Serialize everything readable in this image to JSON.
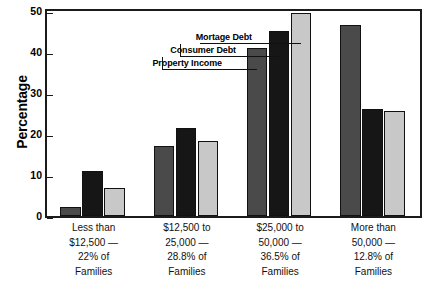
{
  "chart_data": {
    "type": "bar",
    "title": "",
    "xlabel": "",
    "ylabel": "Percentage",
    "ylim": [
      0,
      50
    ],
    "yticks": [
      0,
      10,
      20,
      30,
      40,
      50
    ],
    "grid": false,
    "legend_position": "callout-leader-lines-over-third-group",
    "categories": [
      "Less than $12,500 — 22% of Families",
      "$12,500 to 25,000 — 28.8% of Families",
      "$25,000 to 50,000 — 36.5% of Families",
      "More than 50,000 — 12.8% of Families"
    ],
    "category_lines": [
      [
        "Less than",
        "$12,500 —",
        "22% of",
        "Families"
      ],
      [
        "$12,500 to",
        "25,000 —",
        "28.8% of",
        "Families"
      ],
      [
        "$25,000 to",
        "50,000 —",
        "36.5% of",
        "Families"
      ],
      [
        "More than",
        "50,000 —",
        "12.8% of",
        "Families"
      ]
    ],
    "series": [
      {
        "name": "Mortage Debt",
        "color": "#4a4a4a",
        "values": [
          2.3,
          17.0,
          41.0,
          46.5
        ]
      },
      {
        "name": "Consumer Debt",
        "color": "#161616",
        "values": [
          11.0,
          21.5,
          45.2,
          26.0
        ]
      },
      {
        "name": "Property Income",
        "color": "#c8c8c8",
        "values": [
          6.9,
          18.2,
          49.6,
          25.5
        ]
      }
    ]
  },
  "axis": {
    "y_title": "Percentage",
    "y_tick_labels": [
      "0",
      "10",
      "20",
      "30",
      "40",
      "50"
    ]
  },
  "legend": {
    "items": [
      "Mortage Debt",
      "Consumer Debt",
      "Property Income"
    ]
  }
}
